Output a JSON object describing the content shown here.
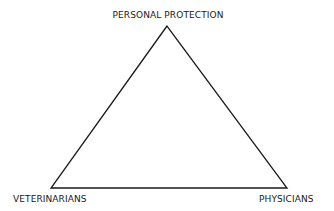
{
  "diagram": {
    "type": "triangle",
    "vertices": {
      "top": {
        "label": "PERSONAL PROTECTION",
        "x": 167,
        "y": 26
      },
      "bottom_left": {
        "label": "VETERINARIANS",
        "x": 51,
        "y": 188
      },
      "bottom_right": {
        "label": "PHYSICIANS",
        "x": 287,
        "y": 188
      }
    },
    "colors": {
      "line": "#1a1a1a",
      "background": "#ffffff"
    }
  }
}
